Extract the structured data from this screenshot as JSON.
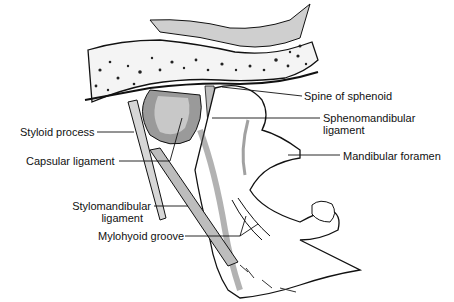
{
  "figure": {
    "labels": {
      "spine_of_sphenoid": "Spine of sphenoid",
      "sphenomandibular_1": "Sphenomandibular",
      "sphenomandibular_2": "ligament",
      "mandibular_foramen": "Mandibular foramen",
      "styloid_process": "Styloid process",
      "capsular_ligament": "Capsular ligament",
      "stylomandibular_1": "Stylomandibular",
      "stylomandibular_2": "ligament",
      "mylohyoid_groove": "Mylohyoid groove"
    },
    "colors": {
      "ink": "#111111",
      "ligament_gray": "#bdbdbd",
      "shade_gray": "#7a7a7a",
      "background": "#ffffff"
    }
  }
}
